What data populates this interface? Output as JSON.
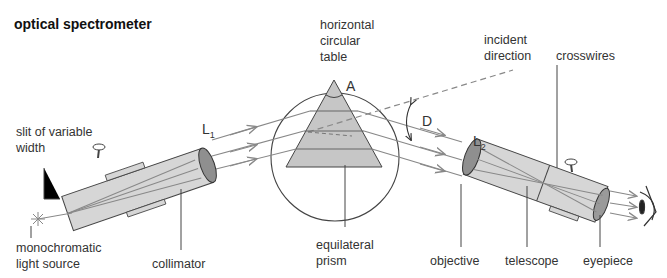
{
  "title": "optical spectrometer",
  "labels": {
    "table": [
      "horizontal",
      "circular",
      "table"
    ],
    "incident": [
      "incident",
      "direction"
    ],
    "crosswires": "crosswires",
    "slit": [
      "slit of variable",
      "width"
    ],
    "source": [
      "monochromatic",
      "light source"
    ],
    "collimator": "collimator",
    "prism": [
      "equilateral",
      "prism"
    ],
    "objective": "objective",
    "telescope": "telescope",
    "eyepiece": "eyepiece",
    "L1": "L",
    "L1_sub": "1",
    "L2": "L",
    "L2_sub": "2",
    "apex": "A",
    "deviation": "D"
  },
  "colors": {
    "tube": "#d4d4d4",
    "lens": "#8a8a8a",
    "prism": "#c4c4c4",
    "line": "#555555",
    "ray": "#888888"
  }
}
